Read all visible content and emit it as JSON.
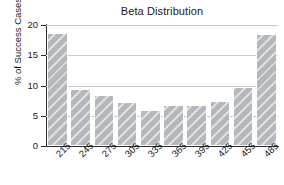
{
  "chart_data": {
    "type": "bar",
    "title": "Beta Distribution",
    "xlabel": "",
    "ylabel": "% of Success Cases",
    "categories": [
      "215",
      "245",
      "275",
      "305",
      "335",
      "365",
      "395",
      "425",
      "455",
      "485"
    ],
    "values": [
      18.7,
      9.4,
      8.5,
      7.3,
      6.0,
      6.8,
      6.8,
      7.5,
      9.8,
      18.5
    ],
    "ylim": [
      0,
      20
    ],
    "yticks": [
      0,
      5,
      10,
      15,
      20
    ],
    "ytick_labels": [
      "0",
      "5",
      "10",
      "15",
      "20"
    ],
    "grid": true,
    "gridlines_at": [
      5,
      10,
      15,
      20
    ],
    "legend": null,
    "legend_position": "none",
    "bar_fill_color": "#b4b8bc",
    "bar_edge_color": "#ffffff",
    "bar_hatch": "diagonal-stripes",
    "axis_color": "#2b2b2b",
    "grid_color": "#c9c9c9",
    "background_color": "#ffffff",
    "xtick_label_rotation": -45
  }
}
